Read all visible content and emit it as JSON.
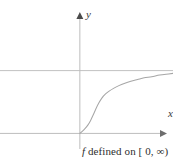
{
  "figure": {
    "background_color": "#ffffff",
    "width": 173,
    "height": 164,
    "caption": {
      "function_symbol": "f",
      "text": " defined on [ 0, ∞)",
      "full_text": "f defined on [ 0, ∞)"
    },
    "axes": {
      "y_label": "y",
      "x_label": "x",
      "axis_color": "#b9b9b9",
      "origin": {
        "x": 81,
        "y": 113
      }
    },
    "asymptote": {
      "label": "",
      "color": "#c2c2c2",
      "y": 62
    },
    "curve": {
      "color": "#a6a6a6",
      "description": "increasing concave-up then concave-down curve from origin approaching horizontal asymptote"
    }
  },
  "chart_data": {
    "type": "line",
    "title": "",
    "subtitle": "",
    "xlabel": "x",
    "ylabel": "y",
    "caption": "f defined on [ 0, ∞)",
    "grid": false,
    "legend": null,
    "legend_position": "none",
    "domain_note": "[ 0, ∞)",
    "xlim": [
      -1.8,
      2.1
    ],
    "ylim": [
      -0.55,
      2.4
    ],
    "annotations": [
      {
        "type": "horizontal-line",
        "y": 1.13,
        "label": "",
        "style": "solid",
        "note": "horizontal asymptote line drawn across full plot width"
      },
      {
        "type": "arrowhead",
        "axis": "y",
        "direction": "up"
      },
      {
        "type": "arrowhead",
        "axis": "x",
        "direction": "right"
      }
    ],
    "series": [
      {
        "name": "f",
        "x": [
          0.0,
          0.06,
          0.12,
          0.18,
          0.24,
          0.3,
          0.36,
          0.43,
          0.5,
          0.58,
          0.66,
          0.76,
          0.88,
          1.0,
          1.15,
          1.3,
          1.45,
          1.62,
          1.8,
          2.0,
          2.1
        ],
        "y": [
          0.0,
          0.04,
          0.09,
          0.15,
          0.23,
          0.33,
          0.44,
          0.55,
          0.64,
          0.71,
          0.76,
          0.81,
          0.86,
          0.9,
          0.94,
          0.97,
          1.0,
          1.02,
          1.05,
          1.07,
          1.08
        ]
      }
    ],
    "xticks": [],
    "yticks": [],
    "xticklabels": [],
    "yticklabels": []
  }
}
